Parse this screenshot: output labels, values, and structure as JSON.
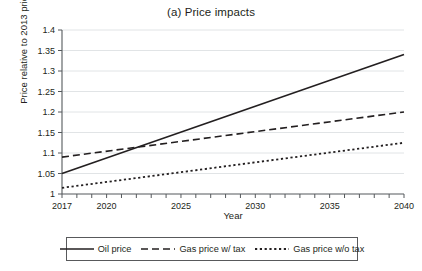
{
  "chart_data": {
    "type": "line",
    "title": "(a) Price impacts",
    "xlabel": "Year",
    "ylabel": "Price relative to 2013 price",
    "xlim": [
      2017,
      2040
    ],
    "ylim": [
      1,
      1.4
    ],
    "ytick_step": 0.05,
    "grid": "horizontal",
    "legend_position": "bottom",
    "x": [
      2017,
      2040
    ],
    "xticks": [
      2017,
      2018,
      2019,
      2020,
      2021,
      2022,
      2023,
      2024,
      2025,
      2026,
      2027,
      2028,
      2029,
      2030,
      2031,
      2032,
      2033,
      2034,
      2035,
      2036,
      2037,
      2038,
      2039,
      2040
    ],
    "xtick_labels": [
      "2017",
      "2020",
      "2025",
      "2030",
      "2035",
      "2040"
    ],
    "xtick_label_values": [
      2017,
      2020,
      2025,
      2030,
      2035,
      2040
    ],
    "ytick_labels": [
      "1",
      "1.05",
      "1.1",
      "1.15",
      "1.2",
      "1.25",
      "1.3",
      "1.35",
      "1.4"
    ],
    "ytick_values": [
      1,
      1.05,
      1.1,
      1.15,
      1.2,
      1.25,
      1.3,
      1.35,
      1.4
    ],
    "series": [
      {
        "name": "Oil price",
        "style": "solid",
        "x": [
          2017,
          2040
        ],
        "values": [
          1.05,
          1.34
        ]
      },
      {
        "name": "Gas price w/ tax",
        "style": "dashed",
        "x": [
          2017,
          2040
        ],
        "values": [
          1.09,
          1.2
        ]
      },
      {
        "name": "Gas price w/o tax",
        "style": "dotted",
        "x": [
          2017,
          2040
        ],
        "values": [
          1.015,
          1.125
        ]
      }
    ]
  },
  "legend": {
    "items": [
      {
        "label": "Oil price"
      },
      {
        "label": "Gas price w/ tax"
      },
      {
        "label": "Gas price w/o tax"
      }
    ]
  }
}
